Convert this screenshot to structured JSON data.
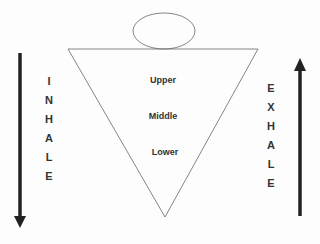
{
  "diagram": {
    "head_shape": "ellipse",
    "torso_shape": "inverted-triangle",
    "regions": [
      {
        "label": "Upper"
      },
      {
        "label": "Middle"
      },
      {
        "label": "Lower"
      }
    ],
    "left_label": {
      "letters": [
        "I",
        "N",
        "H",
        "A",
        "L",
        "E"
      ],
      "direction": "down"
    },
    "right_label": {
      "letters": [
        "E",
        "X",
        "H",
        "A",
        "L",
        "E"
      ],
      "direction": "up"
    },
    "colors": {
      "stroke": "#555555",
      "arrow": "#222222",
      "text": "#333333"
    }
  }
}
